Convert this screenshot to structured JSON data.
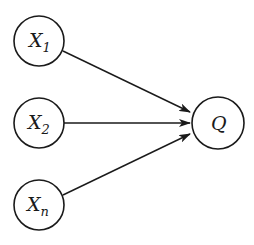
{
  "diagram": {
    "nodes": [
      {
        "id": "X1",
        "base": "X",
        "sub": "1",
        "cx": 39,
        "cy": 41,
        "r": 25
      },
      {
        "id": "X2",
        "base": "X",
        "sub": "2",
        "cx": 39,
        "cy": 123,
        "r": 25
      },
      {
        "id": "Xn",
        "base": "X",
        "sub": "n",
        "cx": 39,
        "cy": 205,
        "r": 25
      },
      {
        "id": "Q",
        "base": "Q",
        "sub": "",
        "cx": 218,
        "cy": 123,
        "r": 26
      }
    ],
    "edges": [
      {
        "from": "X1",
        "to": "Q"
      },
      {
        "from": "X2",
        "to": "Q"
      },
      {
        "from": "Xn",
        "to": "Q"
      }
    ],
    "colors": {
      "stroke": "#1a1a1a",
      "background": "#ffffff"
    }
  }
}
